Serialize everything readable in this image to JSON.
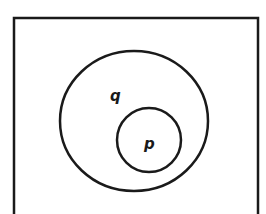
{
  "diagram": {
    "type": "venn",
    "universe": {
      "label": ""
    },
    "sets": [
      {
        "name": "q",
        "label": "q",
        "contains": [
          "p"
        ]
      },
      {
        "name": "p",
        "label": "p",
        "subset_of": "q"
      }
    ],
    "stroke_color": "#1a1a1a",
    "background": "#ffffff"
  }
}
